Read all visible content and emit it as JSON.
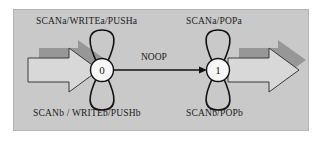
{
  "diagram": {
    "panel_color": "#c9c9c9",
    "panel_border_color": "#b4b4b4",
    "arrow_fill_color": "#d6d6d6",
    "arrow_shadow_color": "#8e8e8e",
    "node_fill_color": "#f5f5f5",
    "stroke_color": "#111111",
    "states": [
      {
        "id": "0",
        "label": "0"
      },
      {
        "id": "1",
        "label": "1"
      }
    ],
    "self_loops": [
      {
        "state": "0",
        "position": "top",
        "label": "SCANa/WRITEa/PUSHa"
      },
      {
        "state": "0",
        "position": "bottom",
        "label": "SCANb / WRITEb/PUSHb"
      },
      {
        "state": "1",
        "position": "top",
        "label": "SCANa/POPa"
      },
      {
        "state": "1",
        "position": "bottom",
        "label": "SCANb/POPb"
      }
    ],
    "transitions": [
      {
        "from": "0",
        "to": "1",
        "label": "NOOP"
      }
    ],
    "block_arrows": [
      {
        "name": "entry-arrow",
        "direction": "right",
        "points_to": "0"
      },
      {
        "name": "exit-arrow",
        "direction": "right",
        "points_from": "1"
      }
    ]
  }
}
